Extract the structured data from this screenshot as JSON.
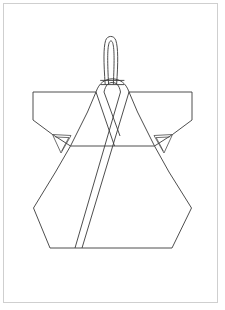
{
  "page": {
    "width": 225,
    "height": 310,
    "background_color": "#ffffff",
    "border_color": "#cfcfcf",
    "title": ""
  },
  "figure": {
    "name": "wrap-jacket-line-drawing",
    "stroke_color": "#3a3a3a",
    "fill_color": "#ffffff",
    "stroke_width": 0.9,
    "orientation": "front view, flat lay",
    "parts": [
      {
        "name": "hanging-loop",
        "label": "Hanging loop",
        "description": "Narrow elongated U-shaped loop rising from the neck opening"
      },
      {
        "name": "neck-opening",
        "label": "Neck opening",
        "description": "Horizontal band line at the top center of the collar"
      },
      {
        "name": "left-shoulder-sleeve",
        "label": "Left sleeve",
        "description": "Wide straight sleeve with horizontal shoulder seam, vertical cuff and angled underarm seam"
      },
      {
        "name": "right-shoulder-sleeve",
        "label": "Right sleeve",
        "description": "Mirror of left sleeve"
      },
      {
        "name": "left-armpit-gusset",
        "label": "Left underarm gusset",
        "description": "Small triangular V gusset at the left armhole junction"
      },
      {
        "name": "right-armpit-gusset",
        "label": "Right underarm gusset",
        "description": "Small triangular V gusset at the right armhole junction"
      },
      {
        "name": "collar-band-outer",
        "label": "Outer collar band",
        "description": "Left-over-right crossed collar band running from shoulder to lower hem"
      },
      {
        "name": "collar-band-inner",
        "label": "Inner collar band",
        "description": "Under lapel band forming the V crossover"
      },
      {
        "name": "body-panel",
        "label": "Body panel",
        "description": "Hexagonal body widening below the armpits then tapering to a flat hem"
      },
      {
        "name": "hem-line",
        "label": "Hem",
        "description": "Straight horizontal bottom edge"
      }
    ]
  },
  "geometry": {
    "loop": {
      "left_x": 104,
      "right_x": 117,
      "top_y": 36,
      "base_y": 84
    },
    "neck": {
      "left_x": 100,
      "right_x": 124,
      "y": 80
    },
    "shoulder": {
      "y": 92,
      "left_x": 33,
      "right_x": 192
    },
    "cuff": {
      "left_x": 33,
      "right_x": 192,
      "top_y": 92,
      "bottom_y": 120
    },
    "armpit": {
      "left_x": 63,
      "right_x": 162,
      "y": 142
    },
    "body": {
      "widest_left_x": 33,
      "widest_right_x": 192,
      "widest_top_y": 208,
      "hem_left_x": 50,
      "hem_right_x": 172,
      "hem_y": 248
    }
  }
}
